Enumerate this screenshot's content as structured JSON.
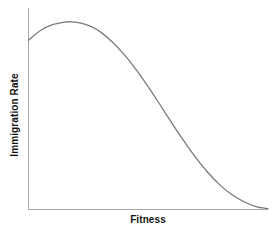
{
  "chart_data": {
    "type": "line",
    "title": "",
    "subtitle": "",
    "xlabel": "Fitness",
    "ylabel": "Immigration Rate",
    "xlim": [
      0,
      1
    ],
    "ylim": [
      0,
      1
    ],
    "grid": false,
    "legend": null,
    "xticks": [],
    "yticks": [],
    "xticklabels": [],
    "yticklabels": [],
    "annotations": [],
    "series": [
      {
        "name": "immigration-rate-curve",
        "color": "#7a7a7a",
        "linewidth": 1.3,
        "x": [
          0.0,
          0.05,
          0.1,
          0.15,
          0.18,
          0.22,
          0.26,
          0.3,
          0.35,
          0.4,
          0.45,
          0.5,
          0.55,
          0.6,
          0.65,
          0.7,
          0.75,
          0.8,
          0.85,
          0.9,
          0.95,
          1.0
        ],
        "y": [
          0.875,
          0.925,
          0.955,
          0.968,
          0.97,
          0.963,
          0.946,
          0.918,
          0.866,
          0.8,
          0.722,
          0.634,
          0.54,
          0.444,
          0.352,
          0.266,
          0.19,
          0.126,
          0.076,
          0.04,
          0.015,
          0.004
        ]
      }
    ]
  },
  "axes": {
    "y_axis_color": "#a8a8a8",
    "x_axis_color": "#a8a8a8",
    "axis_width": 1
  },
  "colors": {
    "background": "#ffffff",
    "curve": "#7a7a7a",
    "text": "#141414",
    "axis": "#a8a8a8"
  }
}
